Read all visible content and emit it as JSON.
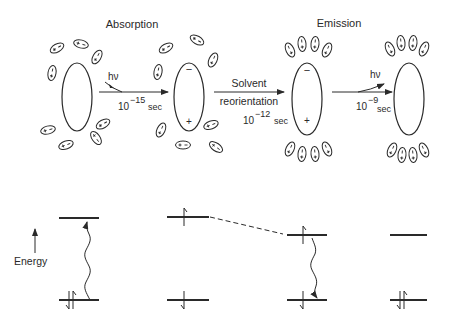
{
  "title_left": "Absorption",
  "title_right": "Emission",
  "step1": {
    "label": "hν",
    "time_base": "10",
    "time_exp": "−15",
    "time_unit": "sec"
  },
  "step2": {
    "label_line1": "Solvent",
    "label_line2": "reorientation",
    "time_base": "10",
    "time_exp": "−12",
    "time_unit": "sec"
  },
  "step3": {
    "label": "hν",
    "time_base": "10",
    "time_exp": "−9",
    "time_unit": "sec"
  },
  "solute_charges": {
    "stage1": {
      "top": "",
      "bottom": ""
    },
    "stage2": {
      "top": "−",
      "bottom": "+"
    },
    "stage3": {
      "top": "−",
      "bottom": "+"
    },
    "stage4": {
      "top": "",
      "bottom": ""
    }
  },
  "energy_axis_label": "Energy",
  "energy_levels": [
    {
      "stage": 1,
      "upper": "empty",
      "lower": "paired",
      "transition": "absorption-up"
    },
    {
      "stage": 2,
      "upper": "spin-up",
      "lower": "spin-down",
      "transition": "none"
    },
    {
      "stage": 3,
      "upper": "spin-up",
      "lower": "spin-down",
      "transition": "emission-down"
    },
    {
      "stage": 4,
      "upper": "empty",
      "lower": "paired",
      "transition": "none"
    }
  ],
  "connector": "dashed relaxation line from stage 2 upper level to stage 3 upper level"
}
